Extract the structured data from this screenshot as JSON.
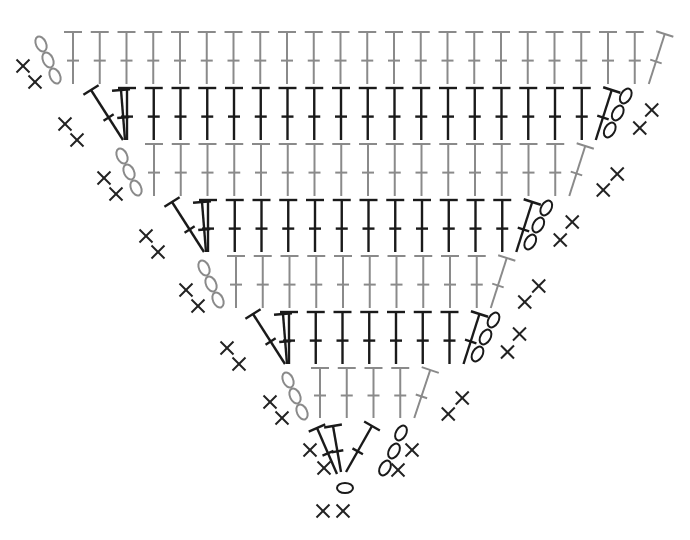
{
  "diagram": {
    "type": "crochet-chart",
    "shape": "inverted-triangle",
    "colors": {
      "gray_row": "#8a8a8a",
      "black_row": "#1a1a1a",
      "marker": "#222222"
    },
    "legend_symbols": {
      "T": "double-crochet",
      "O": "chain",
      "X": "single-crochet"
    },
    "rows": [
      {
        "row": 1,
        "color": "gray",
        "y_top": 32,
        "y_bot": 84,
        "x_start": 73,
        "spacing": 26.75,
        "straight": 22,
        "slant_left": 0,
        "slant_right": 1,
        "chains_left": 3,
        "chains_right": 0,
        "sc_left": 2,
        "sc_right": 0
      },
      {
        "row": 2,
        "color": "black",
        "y_top": 88,
        "y_bot": 140,
        "x_start": 127,
        "spacing": 26.75,
        "straight": 18,
        "slant_left": 2,
        "slant_right": 1,
        "chains_left": 0,
        "chains_right": 3,
        "sc_left": 2,
        "sc_right": 2
      },
      {
        "row": 3,
        "color": "gray",
        "y_top": 144,
        "y_bot": 196,
        "x_start": 154,
        "spacing": 26.75,
        "straight": 16,
        "slant_left": 0,
        "slant_right": 1,
        "chains_left": 3,
        "chains_right": 0,
        "sc_left": 2,
        "sc_right": 2
      },
      {
        "row": 4,
        "color": "black",
        "y_top": 200,
        "y_bot": 252,
        "x_start": 208,
        "spacing": 26.75,
        "straight": 12,
        "slant_left": 2,
        "slant_right": 1,
        "chains_left": 0,
        "chains_right": 3,
        "sc_left": 2,
        "sc_right": 2
      },
      {
        "row": 5,
        "color": "gray",
        "y_top": 256,
        "y_bot": 308,
        "x_start": 236,
        "spacing": 26.75,
        "straight": 10,
        "slant_left": 0,
        "slant_right": 1,
        "chains_left": 3,
        "chains_right": 0,
        "sc_left": 2,
        "sc_right": 2
      },
      {
        "row": 6,
        "color": "black",
        "y_top": 312,
        "y_bot": 364,
        "x_start": 289,
        "spacing": 26.75,
        "straight": 7,
        "slant_left": 2,
        "slant_right": 1,
        "chains_left": 0,
        "chains_right": 3,
        "sc_left": 2,
        "sc_right": 2
      },
      {
        "row": 7,
        "color": "gray",
        "y_top": 368,
        "y_bot": 418,
        "x_start": 320,
        "spacing": 26.75,
        "straight": 4,
        "slant_left": 0,
        "slant_right": 1,
        "chains_left": 3,
        "chains_right": 0,
        "sc_left": 2,
        "sc_right": 2
      },
      {
        "row": 8,
        "color": "black",
        "y_top": 424,
        "y_bot": 476,
        "x_start": 0,
        "spacing": 0,
        "straight": 0,
        "slant_left": 0,
        "slant_right": 0,
        "chains_left": 0,
        "chains_right": 3,
        "sc_left": 2,
        "sc_right": 2
      }
    ],
    "center_chain": {
      "x": 345,
      "y": 482
    },
    "base_sc": [
      {
        "x": 337,
        "y": 505
      },
      {
        "x": 357,
        "y": 505
      }
    ]
  }
}
